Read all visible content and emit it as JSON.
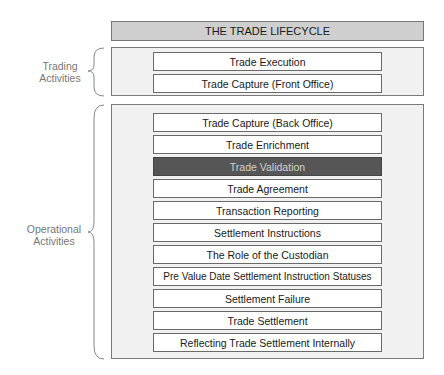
{
  "title": "THE TRADE LIFECYCLE",
  "groups": [
    {
      "label_line1": "Trading",
      "label_line2": "Activities",
      "steps": [
        {
          "label": "Trade Execution",
          "highlighted": false
        },
        {
          "label": "Trade Capture (Front Office)",
          "highlighted": false
        }
      ]
    },
    {
      "label_line1": "Operational",
      "label_line2": "Activities",
      "steps": [
        {
          "label": "Trade Capture (Back Office)",
          "highlighted": false
        },
        {
          "label": "Trade Enrichment",
          "highlighted": false
        },
        {
          "label": "Trade Validation",
          "highlighted": true
        },
        {
          "label": "Trade Agreement",
          "highlighted": false
        },
        {
          "label": "Transaction Reporting",
          "highlighted": false
        },
        {
          "label": "Settlement Instructions",
          "highlighted": false
        },
        {
          "label": "The Role of the Custodian",
          "highlighted": false
        },
        {
          "label": "Pre Value Date Settlement Instruction Statuses",
          "highlighted": false
        },
        {
          "label": "Settlement Failure",
          "highlighted": false
        },
        {
          "label": "Trade Settlement",
          "highlighted": false
        },
        {
          "label": "Reflecting Trade Settlement Internally",
          "highlighted": false
        }
      ]
    }
  ],
  "colors": {
    "title_fill": "#cfcfcf",
    "group_fill": "#f1f1f1",
    "highlight_fill": "#565656",
    "highlight_text": "#d2d2d2"
  }
}
